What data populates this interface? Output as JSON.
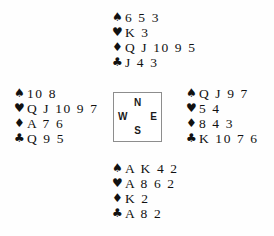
{
  "diagram": {
    "type": "bridge-deal",
    "suit_symbols": {
      "spades": "♠",
      "hearts": "♥",
      "diamonds": "♦",
      "clubs": "♣"
    },
    "compass": {
      "north": "N",
      "west": "W",
      "east": "E",
      "south": "S"
    },
    "hands": {
      "north": {
        "spades": "6 5 3",
        "hearts": "K 3",
        "diamonds": "Q J 10 9 5",
        "clubs": "J 4 3"
      },
      "west": {
        "spades": "10 8",
        "hearts": "Q J 10 9 7",
        "diamonds": "A 7 6",
        "clubs": "Q 9 5"
      },
      "east": {
        "spades": "Q J 9 7",
        "hearts": "5 4",
        "diamonds": "8 4 3",
        "clubs": "K 10 7 6"
      },
      "south": {
        "spades": "A K 4 2",
        "hearts": "A 8 6 2",
        "diamonds": "K 2",
        "clubs": "A 8 2"
      }
    }
  },
  "colors": {
    "ink": "#111111",
    "box_border": "#8d8d8d",
    "background": "#fefefe"
  }
}
